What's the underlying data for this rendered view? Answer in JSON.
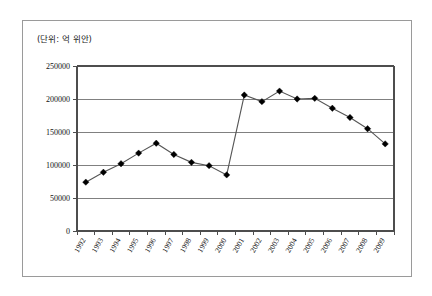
{
  "figure": {
    "unit_note": "(단위: 억 위안)"
  },
  "chart_data": {
    "type": "line",
    "title": "",
    "subtitle": "",
    "xlabel": "",
    "ylabel": "",
    "unit_note": "(단위: 억 위안)",
    "grid": true,
    "legend": "none",
    "marker": "diamond",
    "line_color": "#555555",
    "marker_color": "#000000",
    "grid_color": "#808080",
    "ylim": [
      0,
      250000
    ],
    "ytick_labels": [
      "0",
      "50000",
      "100000",
      "150000",
      "200000",
      "250000"
    ],
    "yticks": [
      0,
      50000,
      100000,
      150000,
      200000,
      250000
    ],
    "categories": [
      "1992",
      "1993",
      "1994",
      "1995",
      "1996",
      "1997",
      "1998",
      "1999",
      "2000",
      "2001",
      "2002",
      "2003",
      "2004",
      "2005",
      "2006",
      "2007",
      "2008",
      "2009"
    ],
    "values": [
      74000,
      89000,
      102000,
      118000,
      133000,
      116000,
      104000,
      99000,
      85000,
      206000,
      196000,
      212000,
      200000,
      201000,
      186000,
      172000,
      155000,
      132000
    ],
    "series": [
      {
        "name": "series-1",
        "values": [
          74000,
          89000,
          102000,
          118000,
          133000,
          116000,
          104000,
          99000,
          85000,
          206000,
          196000,
          212000,
          200000,
          201000,
          186000,
          172000,
          155000,
          132000
        ]
      }
    ]
  }
}
